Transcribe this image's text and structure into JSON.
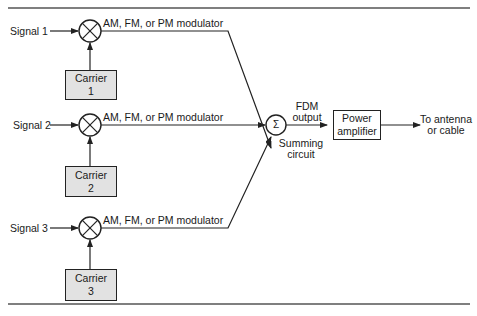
{
  "diagram": {
    "channels": [
      {
        "signal": "Signal 1",
        "modulator": "AM, FM, or PM modulator",
        "carrier_line1": "Carrier",
        "carrier_line2": "1"
      },
      {
        "signal": "Signal 2",
        "modulator": "AM, FM, or PM modulator",
        "carrier_line1": "Carrier",
        "carrier_line2": "2"
      },
      {
        "signal": "Signal 3",
        "modulator": "AM, FM, or PM modulator",
        "carrier_line1": "Carrier",
        "carrier_line2": "3"
      }
    ],
    "summer": {
      "symbol": "Σ",
      "label_line1": "Summing",
      "label_line2": "circuit"
    },
    "fdm_output": {
      "line1": "FDM",
      "line2": "output"
    },
    "amplifier": {
      "line1": "Power",
      "line2": "amplifier"
    },
    "destination": {
      "line1": "To antenna",
      "line2": "or cable"
    },
    "colors": {
      "line": "#222222",
      "carrier_fill": "#e2e2e2",
      "background": "#ffffff"
    }
  }
}
